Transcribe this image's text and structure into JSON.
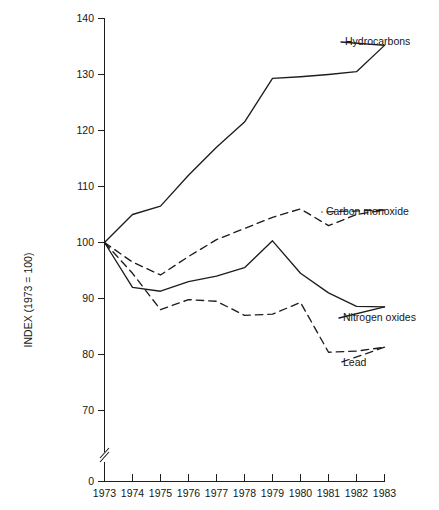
{
  "chart_data": {
    "type": "line",
    "title": "",
    "subtitle": "",
    "xlabel": "",
    "ylabel": "INDEX (1973 = 100)",
    "categories": [
      1973,
      1974,
      1975,
      1976,
      1977,
      1978,
      1979,
      1980,
      1981,
      1982,
      1983
    ],
    "x_tick_labels": [
      "1973",
      "1974",
      "1975",
      "1976",
      "1977",
      "1978",
      "1979",
      "1980",
      "1981",
      "1982",
      "1983"
    ],
    "y_tick_labels": [
      "0",
      "70",
      "80",
      "90",
      "100",
      "110",
      "120",
      "130",
      "140"
    ],
    "y_tick_values": [
      0,
      70,
      80,
      90,
      100,
      110,
      120,
      130,
      140
    ],
    "ylim": [
      70,
      140
    ],
    "xlim": [
      1973,
      1983
    ],
    "axis_break": true,
    "axis_break_note": "y-axis broken between 0 and 70",
    "grid": false,
    "legend_position": "right-inline-labels",
    "series": [
      {
        "name": "Hydrocarbons",
        "style": "solid",
        "label": "Hydrocarbons",
        "values": [
          100.0,
          105.0,
          106.5,
          112.0,
          117.0,
          121.5,
          129.3,
          129.6,
          130.0,
          130.5,
          135.2
        ]
      },
      {
        "name": "Carbon monoxide",
        "style": "dashed",
        "label": "Carbon monoxide",
        "values": [
          100.0,
          96.5,
          94.2,
          97.5,
          100.5,
          102.5,
          104.5,
          106.0,
          103.0,
          105.0,
          105.8
        ]
      },
      {
        "name": "Nitrogen oxides",
        "style": "solid",
        "label": "Nitrogen oxides",
        "values": [
          100.0,
          92.0,
          91.3,
          93.0,
          94.0,
          95.5,
          100.3,
          94.5,
          91.0,
          88.6,
          88.5
        ]
      },
      {
        "name": "Lead",
        "style": "dashed",
        "label": "Lead",
        "values": [
          100.0,
          94.5,
          88.0,
          89.8,
          89.5,
          87.0,
          87.2,
          89.3,
          80.4,
          80.6,
          81.3
        ]
      }
    ]
  }
}
